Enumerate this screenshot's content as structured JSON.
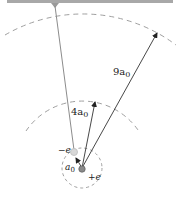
{
  "diagram": {
    "title": "",
    "labels": {
      "outer_radius": "9a",
      "outer_radius_sub": "0",
      "middle_radius": "4a",
      "middle_radius_sub": "0",
      "inner_radius": "a",
      "inner_radius_sub": "0",
      "electron_charge": "−e",
      "nucleus_charge": "+e"
    },
    "elements": {
      "ceiling": "horizontal support bar",
      "string": "pendulum string from ceiling to electron",
      "nucleus": "positive charge at center",
      "electron": "negative charge on string",
      "circles": [
        "inner dashed circle (a0)",
        "middle dashed arc (4a0)",
        "outer dashed arc (9a0)"
      ]
    },
    "colors": {
      "ceiling": "#a8a8a8",
      "dashed": "#9a9a9a",
      "arrow": "#333333",
      "string": "#8c8c8c"
    }
  }
}
